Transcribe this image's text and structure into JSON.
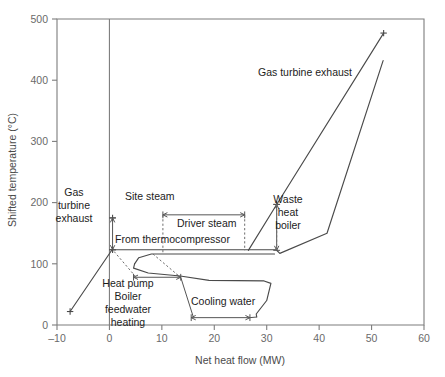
{
  "chart_data": {
    "type": "line",
    "title": "",
    "xlabel": "Net heat flow (MW)",
    "ylabel": "Shifted temperature (°C)",
    "xlim": [
      -10,
      60
    ],
    "ylim": [
      0,
      500
    ],
    "xticks": [
      -10,
      0,
      10,
      20,
      30,
      40,
      50,
      60
    ],
    "xticklabels": [
      "–10",
      "0",
      "10",
      "20",
      "30",
      "40",
      "50",
      "60"
    ],
    "yticks": [
      0,
      100,
      200,
      300,
      400,
      500
    ],
    "yticklabels": [
      "0",
      "100",
      "200",
      "300",
      "400",
      "500"
    ],
    "grid": false,
    "legend": "none",
    "series": [
      {
        "name": "Hot composite curve (gas turbine exhaust + waste heat boiler)",
        "points": [
          [
            -7.5,
            22
          ],
          [
            0.5,
            123
          ],
          [
            31.8,
            123
          ],
          [
            32.5,
            117
          ],
          [
            41.5,
            150
          ],
          [
            52.2,
            432
          ]
        ]
      },
      {
        "name": "Gas turbine exhaust upper branch",
        "points": [
          [
            26.5,
            122
          ],
          [
            31.9,
            197
          ],
          [
            52.3,
            477
          ]
        ]
      },
      {
        "name": "Cold composite curve upper plateau",
        "points": [
          [
            4.8,
            100
          ],
          [
            5.6,
            110
          ],
          [
            8.0,
            116
          ],
          [
            31.5,
            116
          ]
        ]
      },
      {
        "name": "Cold composite lower branch",
        "points": [
          [
            4.8,
            100
          ],
          [
            4.6,
            93
          ],
          [
            7.4,
            85
          ],
          [
            13.5,
            80
          ],
          [
            19.0,
            73
          ],
          [
            29.5,
            72
          ],
          [
            30.8,
            68
          ],
          [
            30.0,
            40
          ],
          [
            28.0,
            18
          ],
          [
            28.1,
            13
          ]
        ]
      }
    ],
    "markers": [
      {
        "x": -7.5,
        "y": 22,
        "glyph": "plus"
      },
      {
        "x": 52.3,
        "y": 477,
        "glyph": "plus"
      },
      {
        "x": 31.9,
        "y": 197,
        "glyph": "plus"
      },
      {
        "x": 0.6,
        "y": 123,
        "glyph": "plus"
      },
      {
        "x": 0.6,
        "y": 175,
        "glyph": "plus"
      }
    ],
    "annotations": [
      {
        "name": "gas-turbine-exhaust-left",
        "lines": [
          "Gas",
          "turbine",
          "exhaust"
        ],
        "x": 74,
        "y": 196
      },
      {
        "name": "gas-turbine-exhaust-right",
        "lines": [
          "Gas turbine exhaust"
        ],
        "x": 258,
        "y": 76
      },
      {
        "name": "site-steam",
        "lines": [
          "Site steam"
        ],
        "x": 125,
        "y": 200
      },
      {
        "name": "driver-steam",
        "lines": [
          "Driver steam"
        ],
        "x": 177,
        "y": 227
      },
      {
        "name": "from-thermocompressor",
        "lines": [
          "From thermocompressor"
        ],
        "x": 115,
        "y": 243
      },
      {
        "name": "waste-heat-boiler",
        "lines": [
          "Waste",
          "heat",
          "boiler"
        ],
        "x": 288,
        "y": 203
      },
      {
        "name": "heat-pump-boiler-feedwater-heating",
        "lines": [
          "Heat pump",
          "Boiler",
          "feedwater",
          "heating"
        ],
        "x": 128,
        "y": 287
      },
      {
        "name": "cooling-water",
        "lines": [
          "Cooling water"
        ],
        "x": 191,
        "y": 305
      }
    ],
    "interval_arrows": [
      {
        "name": "site-steam-span",
        "orientation": "vertical",
        "x": 0.6,
        "y0": 123,
        "y1": 175
      },
      {
        "name": "driver-steam-span",
        "orientation": "horizontal",
        "y": 180,
        "x0": 10.2,
        "x1": 25.8
      },
      {
        "name": "heat-pump-span",
        "orientation": "horizontal",
        "y": 78,
        "x0": 4.6,
        "x1": 13.6
      },
      {
        "name": "cooling-water-span",
        "orientation": "horizontal",
        "y": 12,
        "x0": 15.6,
        "x1": 26.8
      },
      {
        "name": "waste-heat-boiler-span",
        "orientation": "vertical",
        "x": 31.9,
        "y0": 122,
        "y1": 197
      }
    ]
  },
  "colors": {
    "axis": "#7d7d7d",
    "curve": "#4a4a4a",
    "text": "#1c1c1c",
    "ticklabel": "#6a6a6a",
    "background": "#ffffff"
  }
}
